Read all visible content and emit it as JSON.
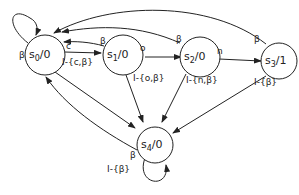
{
  "diagram": {
    "type": "finite-state-machine",
    "states": [
      {
        "id": "s0",
        "name": "s",
        "sub": "0",
        "output": "/0"
      },
      {
        "id": "s1",
        "name": "s",
        "sub": "1",
        "output": "/0"
      },
      {
        "id": "s2",
        "name": "s",
        "sub": "2",
        "output": "/0"
      },
      {
        "id": "s3",
        "name": "s",
        "sub": "3",
        "output": "/1"
      },
      {
        "id": "s4",
        "name": "s",
        "sub": "4",
        "output": "/0"
      }
    ],
    "transitions": [
      {
        "from": "s0",
        "to": "s0",
        "label": "β"
      },
      {
        "from": "s0",
        "to": "s1",
        "label": "c"
      },
      {
        "from": "s0",
        "to": "s4",
        "label": "I-{c,β}"
      },
      {
        "from": "s1",
        "to": "s0",
        "label": "β"
      },
      {
        "from": "s1",
        "to": "s2",
        "label": "o"
      },
      {
        "from": "s1",
        "to": "s4",
        "label": "I-{o,β}"
      },
      {
        "from": "s2",
        "to": "s0",
        "label": "β"
      },
      {
        "from": "s2",
        "to": "s3",
        "label": "n"
      },
      {
        "from": "s2",
        "to": "s4",
        "label": "I-{n,β}"
      },
      {
        "from": "s3",
        "to": "s0",
        "label": "β"
      },
      {
        "from": "s3",
        "to": "s4",
        "label": "I-{β}"
      },
      {
        "from": "s4",
        "to": "s0",
        "label": "β"
      },
      {
        "from": "s4",
        "to": "s4",
        "label": "I-{β}"
      }
    ],
    "labels": {
      "s0_self": "β",
      "s0_s1": "c",
      "s0_s4": "I-{c,β}",
      "s1_s0": "β",
      "s1_s2": "o",
      "s1_s4": "I-{o,β}",
      "s2_s0": "β",
      "s2_s3": "n",
      "s2_s4": "I-{n,β}",
      "s3_s0": "β",
      "s3_s4": "I-{β}",
      "s4_s0": "β",
      "s4_self": "I-{β}"
    }
  }
}
